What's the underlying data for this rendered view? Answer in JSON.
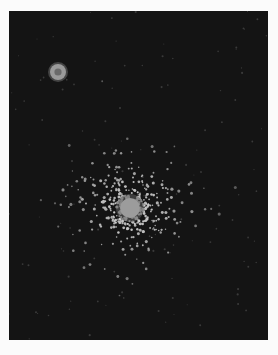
{
  "image": {
    "subject": "star cluster illustration",
    "background_color": "#141414",
    "page_color": "#fbfbfb",
    "plate": {
      "x": 9,
      "y": 11,
      "width": 259,
      "height": 329
    },
    "small_star": {
      "cx": 58,
      "cy": 72,
      "r": 8,
      "color": "#9a9a9a"
    },
    "cluster": {
      "cx": 130,
      "cy": 208,
      "core_r": 10,
      "spread": 70,
      "star_count": 420,
      "color": "#bdbdbd"
    }
  }
}
